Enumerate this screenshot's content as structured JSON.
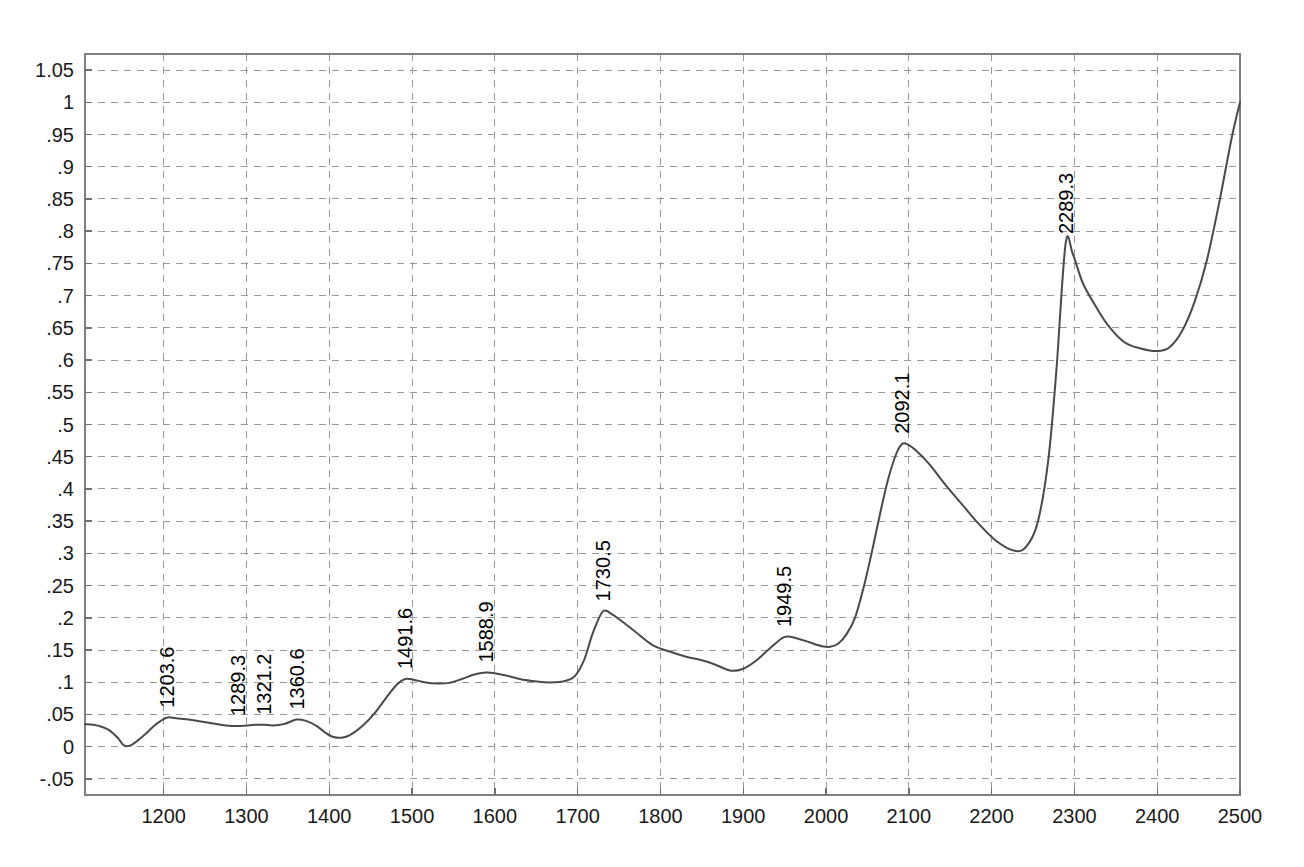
{
  "chart_data": {
    "type": "line",
    "title": "",
    "xlabel": "",
    "ylabel": "",
    "xlim": [
      1105,
      2500
    ],
    "ylim": [
      -0.075,
      1.075
    ],
    "grid": true,
    "legend": "none",
    "series_name": "Transmittance",
    "line_color": "#4a4a4a",
    "grid_color": "#9a9a9a",
    "background_color": "#ffffff",
    "x_ticks": [
      1200,
      1300,
      1400,
      1500,
      1600,
      1700,
      1800,
      1900,
      2000,
      2100,
      2200,
      2300,
      2400,
      2500
    ],
    "x_tick_labels": [
      "1200",
      "1300",
      "1400",
      "1500",
      "1600",
      "1700",
      "1800",
      "1900",
      "2000",
      "2100",
      "2200",
      "2300",
      "2400",
      "2500"
    ],
    "y_ticks": [
      -0.05,
      0,
      0.05,
      0.1,
      0.15,
      0.2,
      0.25,
      0.3,
      0.35,
      0.4,
      0.45,
      0.5,
      0.55,
      0.6,
      0.65,
      0.7,
      0.75,
      0.8,
      0.85,
      0.9,
      0.95,
      1,
      1.05
    ],
    "y_tick_labels": [
      "-.05",
      "0",
      ".05",
      ".1",
      ".15",
      ".2",
      ".25",
      ".3",
      ".35",
      ".4",
      ".45",
      ".5",
      ".55",
      ".6",
      ".65",
      ".7",
      ".75",
      ".8",
      ".85",
      ".9",
      ".95",
      "1",
      "1.05"
    ],
    "annotations": [
      {
        "label": "1203.6",
        "x": 1203.6,
        "y": 0.045
      },
      {
        "label": "1289.3",
        "x": 1289.3,
        "y": 0.032
      },
      {
        "label": "1321.2",
        "x": 1321.2,
        "y": 0.034
      },
      {
        "label": "1360.6",
        "x": 1360.6,
        "y": 0.042
      },
      {
        "label": "1491.6",
        "x": 1491.6,
        "y": 0.105
      },
      {
        "label": "1588.9",
        "x": 1588.9,
        "y": 0.115
      },
      {
        "label": "1730.5",
        "x": 1730.5,
        "y": 0.21
      },
      {
        "label": "1949.5",
        "x": 1949.5,
        "y": 0.17
      },
      {
        "label": "2092.1",
        "x": 2092.1,
        "y": 0.47
      },
      {
        "label": "2289.3",
        "x": 2289.3,
        "y": 0.78
      }
    ],
    "x": [
      1105,
      1115,
      1125,
      1135,
      1145,
      1152,
      1160,
      1170,
      1180,
      1190,
      1203.6,
      1215,
      1230,
      1245,
      1260,
      1275,
      1289.3,
      1300,
      1310,
      1321.2,
      1332,
      1345,
      1360.6,
      1372,
      1385,
      1395,
      1405,
      1415,
      1425,
      1440,
      1455,
      1470,
      1482,
      1491.6,
      1502,
      1515,
      1530,
      1545,
      1560,
      1575,
      1588.9,
      1600,
      1615,
      1630,
      1645,
      1660,
      1672,
      1685,
      1697,
      1708,
      1718,
      1730.5,
      1742,
      1755,
      1770,
      1790,
      1810,
      1830,
      1850,
      1865,
      1885,
      1900,
      1915,
      1930,
      1949.5,
      1965,
      1980,
      1995,
      2005,
      2015,
      2025,
      2035,
      2045,
      2055,
      2065,
      2075,
      2085,
      2092.1,
      2100,
      2110,
      2125,
      2145,
      2165,
      2185,
      2205,
      2225,
      2240,
      2255,
      2268,
      2278,
      2289.3,
      2298,
      2310,
      2325,
      2340,
      2360,
      2380,
      2400,
      2415,
      2430,
      2445,
      2460,
      2475,
      2490,
      2500
    ],
    "y": [
      0.035,
      0.034,
      0.031,
      0.025,
      0.013,
      0.002,
      0.002,
      0.011,
      0.022,
      0.034,
      0.045,
      0.044,
      0.042,
      0.039,
      0.036,
      0.033,
      0.032,
      0.033,
      0.034,
      0.034,
      0.033,
      0.035,
      0.042,
      0.04,
      0.032,
      0.022,
      0.015,
      0.014,
      0.018,
      0.032,
      0.052,
      0.078,
      0.097,
      0.105,
      0.104,
      0.1,
      0.098,
      0.099,
      0.105,
      0.112,
      0.115,
      0.114,
      0.11,
      0.105,
      0.102,
      0.1,
      0.1,
      0.102,
      0.11,
      0.135,
      0.175,
      0.21,
      0.205,
      0.193,
      0.178,
      0.158,
      0.148,
      0.14,
      0.134,
      0.128,
      0.118,
      0.121,
      0.133,
      0.15,
      0.17,
      0.168,
      0.162,
      0.156,
      0.155,
      0.16,
      0.175,
      0.2,
      0.245,
      0.3,
      0.36,
      0.415,
      0.455,
      0.47,
      0.468,
      0.458,
      0.438,
      0.405,
      0.375,
      0.345,
      0.32,
      0.305,
      0.308,
      0.345,
      0.44,
      0.58,
      0.78,
      0.765,
      0.72,
      0.685,
      0.655,
      0.628,
      0.618,
      0.614,
      0.62,
      0.645,
      0.69,
      0.755,
      0.845,
      0.945,
      1.0
    ]
  }
}
